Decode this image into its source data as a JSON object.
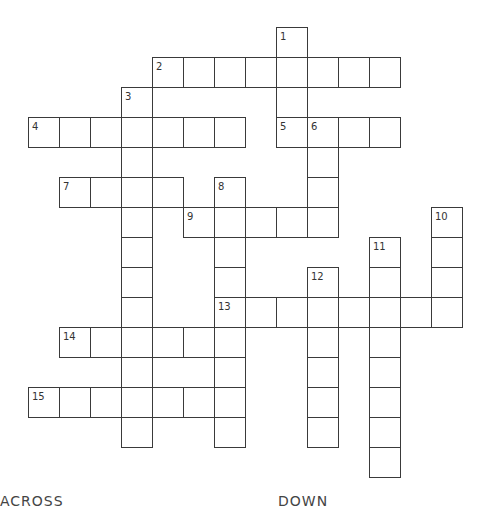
{
  "puzzle": {
    "grid_origin": {
      "x": 28,
      "y": 27
    },
    "cell_size": {
      "w": 31,
      "h": 30
    },
    "entries": [
      {
        "number": 1,
        "direction": "down",
        "col": 8,
        "row": 0,
        "length": 4
      },
      {
        "number": 2,
        "direction": "across",
        "col": 4,
        "row": 1,
        "length": 8
      },
      {
        "number": 3,
        "direction": "down",
        "col": 3,
        "row": 2,
        "length": 12
      },
      {
        "number": 4,
        "direction": "across",
        "col": 0,
        "row": 3,
        "length": 7
      },
      {
        "number": 5,
        "direction": "across",
        "col": 8,
        "row": 3,
        "length": 4
      },
      {
        "number": 6,
        "direction": "down",
        "col": 9,
        "row": 3,
        "length": 4
      },
      {
        "number": 7,
        "direction": "across",
        "col": 1,
        "row": 5,
        "length": 4
      },
      {
        "number": 8,
        "direction": "down",
        "col": 6,
        "row": 5,
        "length": 9
      },
      {
        "number": 9,
        "direction": "across",
        "col": 5,
        "row": 6,
        "length": 5
      },
      {
        "number": 10,
        "direction": "down",
        "col": 13,
        "row": 6,
        "length": 4
      },
      {
        "number": 11,
        "direction": "down",
        "col": 11,
        "row": 7,
        "length": 8
      },
      {
        "number": 12,
        "direction": "down",
        "col": 9,
        "row": 8,
        "length": 6
      },
      {
        "number": 13,
        "direction": "across",
        "col": 6,
        "row": 9,
        "length": 8
      },
      {
        "number": 14,
        "direction": "across",
        "col": 1,
        "row": 10,
        "length": 6
      },
      {
        "number": 15,
        "direction": "across",
        "col": 0,
        "row": 12,
        "length": 7
      }
    ]
  },
  "clues": {
    "across_heading": "ACROSS",
    "down_heading": "DOWN"
  },
  "colors": {
    "border": "#3a3a3a",
    "number": "#333333",
    "background": "#ffffff"
  }
}
